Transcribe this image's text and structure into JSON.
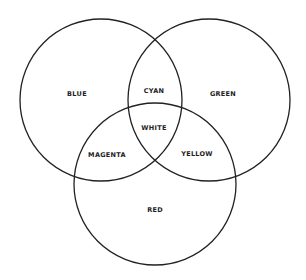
{
  "diagram": {
    "type": "venn",
    "circles": [
      {
        "name": "blue",
        "label": "BLUE",
        "cx": 101,
        "cy": 100,
        "r": 81
      },
      {
        "name": "green",
        "label": "GREEN",
        "cx": 209,
        "cy": 100,
        "r": 81
      },
      {
        "name": "red",
        "label": "RED",
        "cx": 155,
        "cy": 184,
        "r": 81
      }
    ],
    "labels": {
      "blue": "BLUE",
      "green": "GREEN",
      "red": "RED",
      "cyan": "CYAN",
      "magenta": "MAGENTA",
      "yellow": "YELLOW",
      "white": "WHITE"
    },
    "stroke_color": "#222222",
    "background": "#ffffff"
  }
}
